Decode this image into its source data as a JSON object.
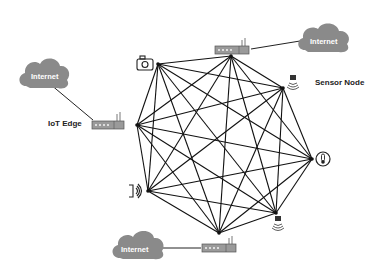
{
  "diagram": {
    "labels": {
      "iot_edge": "IoT Edge",
      "sensor_node": "Sensor Node"
    },
    "clouds": [
      {
        "id": "cloud-left",
        "label": "Internet"
      },
      {
        "id": "cloud-top-right",
        "label": "Internet"
      },
      {
        "id": "cloud-bottom",
        "label": "Internet"
      }
    ],
    "nodes": [
      {
        "id": "camera",
        "icon": "camera-icon",
        "x": 158,
        "y": 64
      },
      {
        "id": "router-top",
        "icon": "router-icon",
        "x": 231,
        "y": 56
      },
      {
        "id": "wifi-top-right",
        "icon": "wireless-sensor-icon",
        "x": 283,
        "y": 88
      },
      {
        "id": "thermometer",
        "icon": "thermometer-icon",
        "x": 312,
        "y": 159
      },
      {
        "id": "wifi-bottom-right",
        "icon": "wireless-sensor-icon",
        "x": 276,
        "y": 213
      },
      {
        "id": "router-bottom",
        "icon": "router-icon",
        "x": 219,
        "y": 233
      },
      {
        "id": "speaker",
        "icon": "sound-sensor-icon",
        "x": 148,
        "y": 191
      },
      {
        "id": "router-left",
        "icon": "router-icon",
        "x": 137,
        "y": 125
      }
    ],
    "topology": "full-mesh",
    "colors": {
      "cloud": "#8a8a8a",
      "router": "#9a9a9a",
      "line": "#111111"
    }
  }
}
